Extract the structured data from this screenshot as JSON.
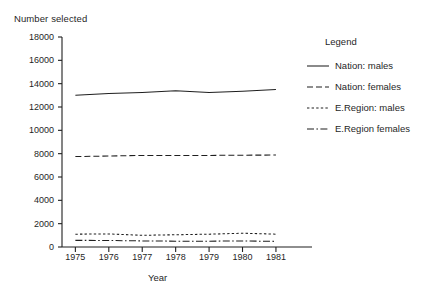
{
  "chart_data": {
    "type": "line",
    "title": "",
    "xlabel": "Year",
    "ylabel": "Number selected",
    "x": [
      1975,
      1976,
      1977,
      1978,
      1979,
      1980,
      1981
    ],
    "xlim": [
      1974.6,
      1981.6
    ],
    "ylim": [
      0,
      18000
    ],
    "ytick_values": [
      0,
      2000,
      4000,
      6000,
      8000,
      10000,
      12000,
      14000,
      16000,
      18000
    ],
    "ytick_labels": [
      "0",
      "2000",
      "4000",
      "6000",
      "8000",
      "10000",
      "12000",
      "14000",
      "16000",
      "18000"
    ],
    "xtick_labels": [
      "1975",
      "1976",
      "1977",
      "1978",
      "1979",
      "1980",
      "1981"
    ],
    "grid": false,
    "legend_position": "right",
    "legend_title": "Legend",
    "series": [
      {
        "name": "Nation: males",
        "style": "solid",
        "color": "#1f1f1f",
        "values": [
          13000,
          13150,
          13250,
          13400,
          13250,
          13350,
          13500
        ]
      },
      {
        "name": "Nation: females",
        "style": "dashed",
        "color": "#1f1f1f",
        "values": [
          7750,
          7800,
          7850,
          7850,
          7850,
          7870,
          7880
        ]
      },
      {
        "name": "E.Region: males",
        "style": "dotted",
        "color": "#1f1f1f",
        "values": [
          1100,
          1120,
          1000,
          1050,
          1100,
          1180,
          1100
        ]
      },
      {
        "name": "E.Region females",
        "style": "dashdot",
        "color": "#1f1f1f",
        "values": [
          570,
          560,
          520,
          500,
          500,
          520,
          480
        ]
      }
    ]
  },
  "axis": {
    "y_title": "Number selected",
    "x_title": "Year"
  },
  "legend": {
    "title": "Legend",
    "items": [
      {
        "label": "Nation: males",
        "style": "solid"
      },
      {
        "label": "Nation: females",
        "style": "dashed"
      },
      {
        "label": "E.Region: males",
        "style": "dotted"
      },
      {
        "label": "E.Region females",
        "style": "dashdot"
      }
    ]
  },
  "colors": {
    "ink": "#1f1f1f",
    "background": "#ffffff"
  }
}
